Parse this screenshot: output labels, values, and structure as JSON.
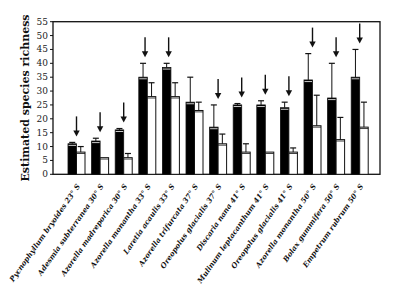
{
  "chart_data": {
    "type": "bar",
    "title": "",
    "xlabel": "",
    "ylabel": "Estimated species richness",
    "ylim": [
      0,
      55
    ],
    "yticks": [
      0,
      5,
      10,
      15,
      20,
      25,
      30,
      35,
      40,
      45,
      50,
      55
    ],
    "grid": false,
    "legend": null,
    "categories": [
      "Pycnophyllum bryoides 23° S",
      "Adesmia subterranea 30° S",
      "Azorella madreporica 30° S",
      "Azorella monantha 33° S",
      "Laretia acaulis 33° S",
      "Azorella trifurcata 37° S",
      "Oreopolus glacialis 37° S",
      "Discaria nana 41° S",
      "Mulinum leptacanthum 41° S",
      "Oreopolus glacialis 41° S",
      "Azorella monantha 50° S",
      "Bolax gummifera 50° S",
      "Empetrum rubrum 50° S"
    ],
    "series": [
      {
        "name": "black bars",
        "color": "#000000",
        "values": [
          11,
          12,
          16,
          35,
          38.5,
          26,
          17,
          25,
          25,
          24,
          34,
          27.5,
          35
        ],
        "error_upper": [
          11.5,
          13,
          16.5,
          40,
          40,
          35,
          25,
          25.5,
          26.5,
          26,
          43.5,
          40,
          45
        ]
      },
      {
        "name": "white bars",
        "color": "#ffffff",
        "values": [
          8,
          6,
          6,
          28,
          28,
          23,
          11,
          8,
          8,
          8,
          17.5,
          12.5,
          17
        ],
        "error_upper": [
          10,
          6,
          7.5,
          33,
          33,
          26,
          14.5,
          11,
          8,
          9.5,
          28.5,
          20.5,
          26
        ]
      }
    ],
    "arrows_over_groups": [
      true,
      true,
      true,
      true,
      true,
      false,
      true,
      true,
      true,
      true,
      true,
      true,
      true
    ],
    "arrow_position": [
      "center",
      "center",
      "center",
      "black",
      "black",
      "none",
      "center",
      "center",
      "center",
      "center",
      "center",
      "center",
      "center"
    ]
  }
}
